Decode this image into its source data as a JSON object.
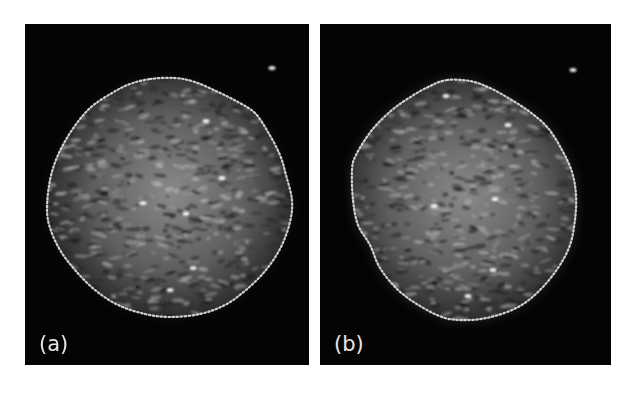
{
  "figure": {
    "background": "#ffffff",
    "panels": [
      {
        "id": "a",
        "label": "(a)",
        "description": "Speckled grayscale circular region on black background with dotted contour outline",
        "background_color": "#040404",
        "contour_color": "#d8d8d8",
        "bright_spots": [
          [
            206,
            121
          ],
          [
            143,
            203
          ],
          [
            193,
            268
          ],
          [
            170,
            290
          ],
          [
            272,
            68
          ],
          [
            186,
            214
          ],
          [
            222,
            178
          ]
        ],
        "contour": [
          [
            150,
            79
          ],
          [
            175,
            78
          ],
          [
            195,
            82
          ],
          [
            218,
            92
          ],
          [
            238,
            102
          ],
          [
            255,
            113
          ],
          [
            268,
            132
          ],
          [
            280,
            155
          ],
          [
            286,
            175
          ],
          [
            292,
            200
          ],
          [
            290,
            222
          ],
          [
            281,
            247
          ],
          [
            266,
            270
          ],
          [
            246,
            290
          ],
          [
            225,
            305
          ],
          [
            200,
            314
          ],
          [
            170,
            317
          ],
          [
            145,
            314
          ],
          [
            118,
            305
          ],
          [
            95,
            290
          ],
          [
            75,
            270
          ],
          [
            60,
            250
          ],
          [
            50,
            228
          ],
          [
            47,
            208
          ],
          [
            50,
            180
          ],
          [
            58,
            155
          ],
          [
            72,
            130
          ],
          [
            90,
            108
          ],
          [
            112,
            93
          ],
          [
            130,
            84
          ]
        ]
      },
      {
        "id": "b",
        "label": "(b)",
        "description": "Speckled grayscale circular region on black background with dotted contour outline and diffuse edge halo",
        "background_color": "#040404",
        "contour_color": "#d8d8d8",
        "bright_spots": [
          [
            434,
            206
          ],
          [
            508,
            125
          ],
          [
            446,
            96
          ],
          [
            493,
            270
          ],
          [
            468,
            296
          ],
          [
            573,
            70
          ],
          [
            495,
            199
          ]
        ],
        "contour": [
          [
            447,
            80
          ],
          [
            470,
            81
          ],
          [
            490,
            88
          ],
          [
            510,
            99
          ],
          [
            530,
            112
          ],
          [
            548,
            128
          ],
          [
            562,
            150
          ],
          [
            572,
            172
          ],
          [
            576,
            195
          ],
          [
            575,
            220
          ],
          [
            570,
            245
          ],
          [
            558,
            268
          ],
          [
            540,
            290
          ],
          [
            520,
            306
          ],
          [
            495,
            316
          ],
          [
            470,
            320
          ],
          [
            445,
            318
          ],
          [
            420,
            306
          ],
          [
            398,
            290
          ],
          [
            380,
            268
          ],
          [
            370,
            245
          ],
          [
            358,
            225
          ],
          [
            353,
            200
          ],
          [
            352,
            170
          ],
          [
            356,
            155
          ],
          [
            372,
            130
          ],
          [
            392,
            110
          ],
          [
            412,
            96
          ],
          [
            430,
            86
          ]
        ]
      }
    ]
  }
}
